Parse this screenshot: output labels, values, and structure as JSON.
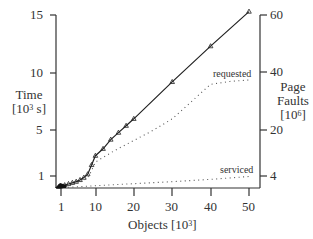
{
  "chart_data": {
    "type": "line",
    "title": "",
    "xlabel": "Objects [10^3]",
    "ylabel": "Time [10^3 s]",
    "y2label": "Page Faults [10^6]",
    "xlim": [
      0,
      50
    ],
    "ylim": [
      0,
      15
    ],
    "y2lim": [
      0,
      60
    ],
    "grid": false,
    "legend": "inline labels",
    "x_ticks": [
      "1",
      "10",
      "20",
      "30",
      "40",
      "50"
    ],
    "y_ticks": [
      "1",
      "5",
      "10",
      "15"
    ],
    "y2_ticks": [
      "4",
      "20",
      "40",
      "60"
    ],
    "series": [
      {
        "name": "time",
        "axis": "left",
        "style": "solid line with triangle markers",
        "x": [
          0.5,
          1,
          2,
          3,
          4,
          5,
          6,
          7,
          8,
          9,
          10,
          12,
          14,
          16,
          18,
          20,
          30,
          40,
          50
        ],
        "values": [
          0.1,
          0.15,
          0.25,
          0.35,
          0.45,
          0.55,
          0.7,
          0.9,
          1.2,
          2.0,
          2.8,
          3.4,
          4.2,
          4.8,
          5.4,
          6.0,
          9.2,
          12.3,
          15.3
        ]
      },
      {
        "name": "requested",
        "axis": "right",
        "style": "dotted",
        "x": [
          0.5,
          2,
          4,
          6,
          8,
          9,
          10,
          15,
          20,
          25,
          30,
          35,
          40,
          45,
          50
        ],
        "values": [
          0.2,
          0.6,
          1.2,
          2.0,
          3.5,
          6.0,
          9.0,
          13.0,
          16.5,
          20.0,
          24.0,
          30.0,
          36.0,
          37.0,
          37.5
        ]
      },
      {
        "name": "serviced",
        "axis": "right",
        "style": "dotted",
        "x": [
          0.5,
          5,
          10,
          20,
          30,
          40,
          50
        ],
        "values": [
          0.1,
          0.4,
          0.8,
          1.5,
          2.2,
          3.0,
          4.0
        ]
      }
    ]
  },
  "labels": {
    "y_left_line1": "Time",
    "y_left_line2_pre": "[10",
    "y_left_exp": "3",
    "y_left_line2_post": " s]",
    "y_right_line1": "Page",
    "y_right_line2": "Faults",
    "y_right_line3_pre": "[10",
    "y_right_exp": "6",
    "y_right_line3_post": "]",
    "x_pre": "Objects [10",
    "x_exp": "3",
    "x_post": "]",
    "requested": "requested",
    "serviced": "serviced"
  },
  "ticks": {
    "y_left": [
      "15",
      "10",
      "5",
      "1"
    ],
    "y_right": [
      "60",
      "40",
      "20",
      "4"
    ],
    "x": [
      "1",
      "10",
      "20",
      "30",
      "40",
      "50"
    ]
  }
}
